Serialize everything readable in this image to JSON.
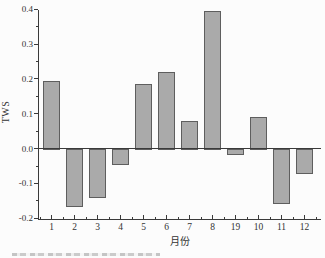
{
  "chart_data": {
    "type": "bar",
    "title": "",
    "xlabel": "月份",
    "ylabel": "TWS",
    "categories": [
      "1",
      "2",
      "3",
      "4",
      "5",
      "6",
      "7",
      "8",
      "19",
      "10",
      "11",
      "12"
    ],
    "values": [
      0.195,
      -0.165,
      -0.14,
      -0.045,
      0.185,
      0.22,
      0.08,
      0.395,
      -0.015,
      0.09,
      -0.155,
      -0.07
    ],
    "ylim": [
      -0.2,
      0.4
    ],
    "ytick_labels": [
      "0.4",
      "0.3",
      "0.2",
      "0.1",
      "0.0",
      "-0.1",
      "-0.2"
    ],
    "ytick_values": [
      0.4,
      0.3,
      0.2,
      0.1,
      0.0,
      -0.1,
      -0.2
    ],
    "minor_ytick_values": [
      0.35,
      0.25,
      0.15,
      0.05,
      -0.05,
      -0.15
    ],
    "grid": false,
    "legend": null,
    "bar_fill": "#aaaaaa",
    "bar_border": "#5e5e5e",
    "axis_color": "#3a3a3a"
  }
}
